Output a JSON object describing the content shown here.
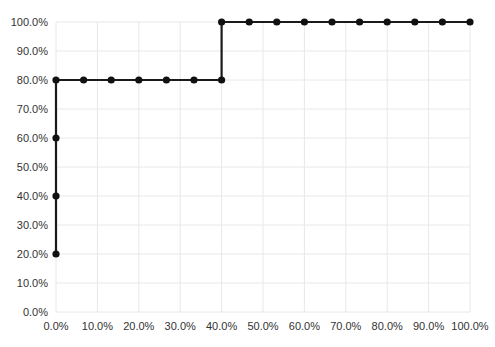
{
  "chart_data": {
    "type": "line",
    "line_style": "step",
    "title": "",
    "xlabel": "",
    "ylabel": "",
    "xlim": [
      0,
      100
    ],
    "ylim": [
      0,
      100
    ],
    "grid": true,
    "legend": "none",
    "x_ticks": [
      0,
      10,
      20,
      30,
      40,
      50,
      60,
      70,
      80,
      90,
      100
    ],
    "x_tick_labels": [
      "0.0%",
      "10.0%",
      "20.0%",
      "30.0%",
      "40.0%",
      "50.0%",
      "60.0%",
      "70.0%",
      "80.0%",
      "90.0%",
      "100.0%"
    ],
    "y_ticks": [
      0,
      10,
      20,
      30,
      40,
      50,
      60,
      70,
      80,
      90,
      100
    ],
    "y_tick_labels": [
      "0.0%",
      "10.0%",
      "20.0%",
      "30.0%",
      "40.0%",
      "50.0%",
      "60.0%",
      "70.0%",
      "80.0%",
      "90.0%",
      "100.0%"
    ],
    "series": [
      {
        "name": "cumulative-step",
        "marker": "circle",
        "points": [
          [
            0,
            20
          ],
          [
            0,
            40
          ],
          [
            0,
            60
          ],
          [
            0,
            80
          ],
          [
            6.67,
            80
          ],
          [
            13.33,
            80
          ],
          [
            20,
            80
          ],
          [
            26.67,
            80
          ],
          [
            33.33,
            80
          ],
          [
            40,
            80
          ],
          [
            40,
            100
          ],
          [
            46.67,
            100
          ],
          [
            53.33,
            100
          ],
          [
            60,
            100
          ],
          [
            66.67,
            100
          ],
          [
            73.33,
            100
          ],
          [
            80,
            100
          ],
          [
            86.67,
            100
          ],
          [
            93.33,
            100
          ],
          [
            100,
            100
          ]
        ]
      }
    ]
  },
  "colors": {
    "background": "#ffffff",
    "grid": "#e8e8e8",
    "line": "#1a1a1a",
    "marker": "#111111",
    "tick_label": "#333333"
  }
}
